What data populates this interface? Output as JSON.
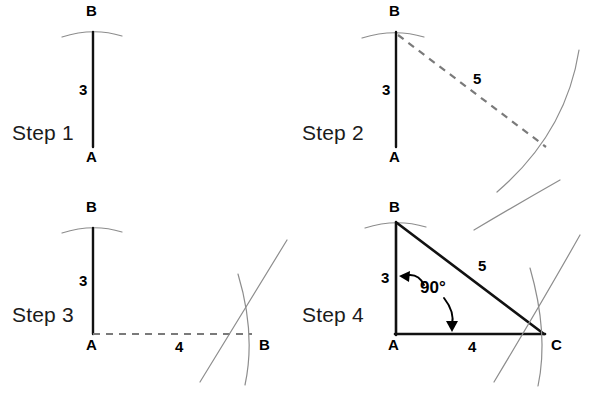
{
  "figure": {
    "colors": {
      "solid_line": "#111111",
      "dashed_line": "#7a7a7a",
      "arc_line": "#8d8d8d",
      "text": "#000000",
      "step_text": "#1b1b1b",
      "background": "#ffffff"
    }
  },
  "steps": [
    {
      "id": "step1",
      "label": "Step 1",
      "points": [
        {
          "name": "A",
          "label": "A"
        },
        {
          "name": "B",
          "label": "B"
        }
      ],
      "lengths": [
        {
          "name": "AB",
          "label": "3"
        }
      ]
    },
    {
      "id": "step2",
      "label": "Step 2",
      "points": [
        {
          "name": "A",
          "label": "A"
        },
        {
          "name": "B",
          "label": "B"
        }
      ],
      "lengths": [
        {
          "name": "AB",
          "label": "3"
        },
        {
          "name": "hypotenuse",
          "label": "5"
        }
      ]
    },
    {
      "id": "step3",
      "label": "Step 3",
      "points": [
        {
          "name": "A",
          "label": "A"
        },
        {
          "name": "B-top",
          "label": "B"
        },
        {
          "name": "B-right",
          "label": "B"
        }
      ],
      "lengths": [
        {
          "name": "AB",
          "label": "3"
        },
        {
          "name": "base",
          "label": "4"
        }
      ]
    },
    {
      "id": "step4",
      "label": "Step 4",
      "points": [
        {
          "name": "A",
          "label": "A"
        },
        {
          "name": "B",
          "label": "B"
        },
        {
          "name": "C",
          "label": "C"
        }
      ],
      "lengths": [
        {
          "name": "AB",
          "label": "3"
        },
        {
          "name": "BC",
          "label": "5"
        },
        {
          "name": "AC",
          "label": "4"
        }
      ],
      "angles": [
        {
          "name": "right-angle",
          "label": "90°"
        }
      ]
    }
  ]
}
